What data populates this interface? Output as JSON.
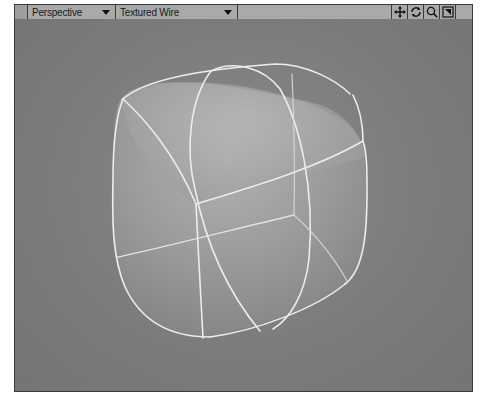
{
  "viewport": {
    "view_mode": "Perspective",
    "render_mode": "Textured Wire",
    "tools": [
      {
        "name": "move-view",
        "icon": "move-icon"
      },
      {
        "name": "rotate-view",
        "icon": "rotate-icon"
      },
      {
        "name": "zoom-view",
        "icon": "magnify-icon"
      },
      {
        "name": "maximize-view",
        "icon": "maximize-icon"
      }
    ],
    "colors": {
      "toolbar_bg": "#a9a9a9",
      "viewport_bg": "#7d7d7d",
      "wire": "#eeeeee",
      "object_fill": "#9a9a9a"
    },
    "object": {
      "type": "subdivided cube",
      "display": "textured wireframe"
    }
  }
}
